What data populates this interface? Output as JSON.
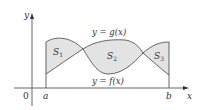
{
  "diagram": {
    "axes": {
      "x_label": "x",
      "y_label": "y",
      "origin_label": "0"
    },
    "bounds": {
      "a_label": "a",
      "b_label": "b"
    },
    "curves": {
      "upper_label": "y = g(x)",
      "lower_label": "y = f(x)"
    },
    "regions": [
      {
        "name": "S",
        "subscript": "1"
      },
      {
        "name": "S",
        "subscript": "2"
      },
      {
        "name": "S",
        "subscript": "3"
      }
    ],
    "colors": {
      "fill": "#e3e3e3",
      "stroke": "#555555",
      "axis": "#555555",
      "text": "#333333"
    }
  }
}
